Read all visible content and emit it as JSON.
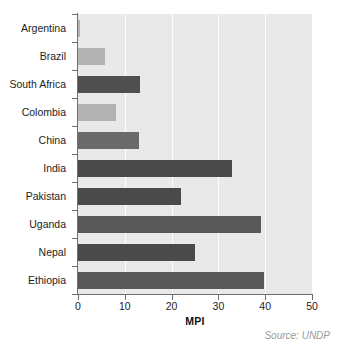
{
  "chart_data": {
    "type": "bar",
    "orientation": "horizontal",
    "title": "",
    "subtitle": "",
    "xlabel": "MPI",
    "ylabel": "",
    "xlim": [
      0,
      50
    ],
    "xticks": [
      0,
      10,
      20,
      30,
      40,
      50
    ],
    "xtick_labels": [
      "0",
      "10",
      "20",
      "30",
      "40",
      "50"
    ],
    "grid": "vertical",
    "legend": "none",
    "categories": [
      "Argentina",
      "Brazil",
      "South Africa",
      "Colombia",
      "China",
      "India",
      "Pakistan",
      "Uganda",
      "Nepal",
      "Ethiopia"
    ],
    "values": [
      0.5,
      5.8,
      13.3,
      8.1,
      13.0,
      32.9,
      22.0,
      39.0,
      25.0,
      39.7
    ],
    "bar_colors": [
      "#b2b2b2",
      "#b2b2b2",
      "#4f4f4f",
      "#b2b2b2",
      "#6a6a6a",
      "#4a4a4a",
      "#4a4a4a",
      "#585858",
      "#4a4a4a",
      "#585858"
    ],
    "annotations": [
      "Source: UNDP"
    ]
  },
  "figure": {
    "source_note": "Source: UNDP",
    "plot_background": "#e9e9e9",
    "page_background": "#ffffff",
    "gridline_color": "#fdfdfd",
    "axis_color": "#6e6e6e",
    "text_color": "#1d1d1d",
    "source_color": "#9a9a9a"
  }
}
